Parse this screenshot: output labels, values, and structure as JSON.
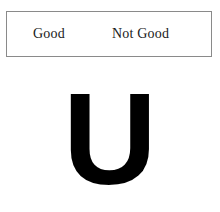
{
  "canvas": {
    "width": 220,
    "height": 212,
    "background_color": "#ffffff"
  },
  "choice_box": {
    "border_color": "#8a8a8a",
    "background_color": "#ffffff",
    "options": [
      {
        "id": "good",
        "label": "Good"
      },
      {
        "id": "not-good",
        "label": "Not Good"
      }
    ]
  },
  "stimulus": {
    "character": "U",
    "color": "#000000",
    "style": "bold-sans-serif"
  }
}
